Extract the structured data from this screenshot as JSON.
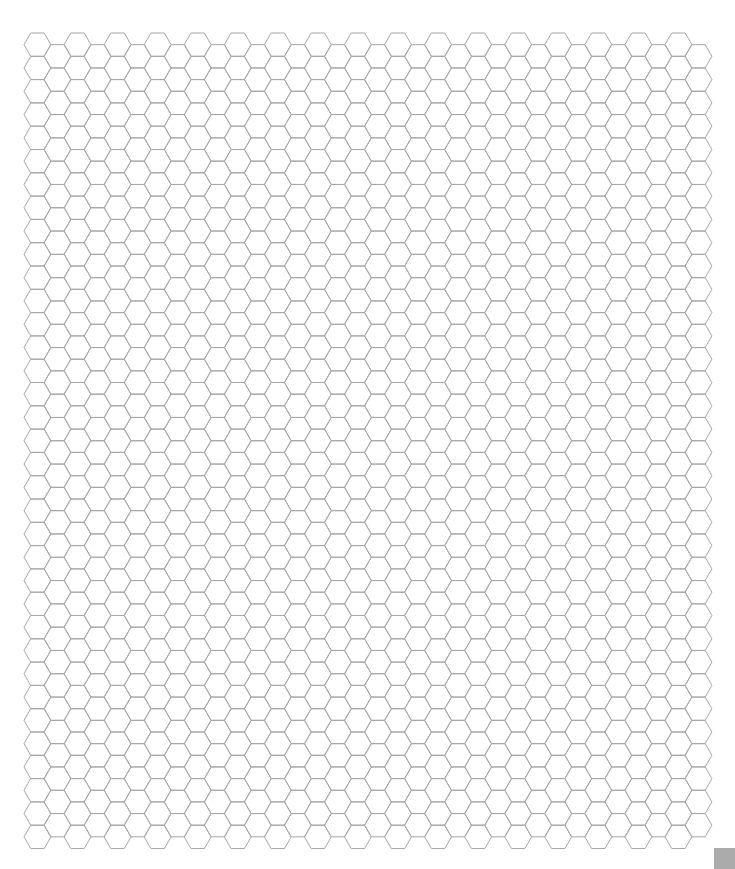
{
  "page": {
    "title": "Hexagonal graph paper",
    "width": 735,
    "height": 869,
    "background": "#ffffff"
  },
  "grid": {
    "orientation": "flat-top",
    "origin_x": 24,
    "origin_y": 33,
    "hex_width": 26.9,
    "hex_height": 23.3,
    "column_spacing": 20.03,
    "columns": 34,
    "rows_even_columns": 35,
    "rows_odd_columns": 34,
    "odd_column_offset": "down-half",
    "line_color": "#a6a6a6",
    "line_width": 1
  },
  "corner_marker": {
    "x": 714,
    "y": 848,
    "size": 21,
    "color": "#ababab"
  }
}
